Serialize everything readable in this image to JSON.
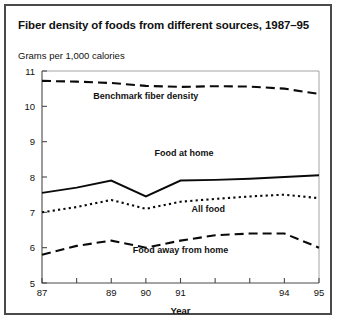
{
  "figure": {
    "title": "Fiber density of foods from different sources, 1987–95",
    "y_axis_title": "Grams per 1,000 calories",
    "x_axis_title": "Year"
  },
  "chart_data": {
    "type": "line",
    "title": "Fiber density of foods from different sources, 1987–95",
    "xlabel": "Year",
    "ylabel": "Grams per 1,000 calories",
    "xlim": [
      87,
      95
    ],
    "ylim": [
      5,
      11
    ],
    "grid": false,
    "legend_position": "inline-annotations",
    "x": [
      87,
      88,
      89,
      90,
      91,
      92,
      93,
      94,
      95
    ],
    "x_tick_labels": [
      "87",
      "",
      "89",
      "90",
      "91",
      "",
      "",
      "94",
      "95"
    ],
    "y_tick_labels": [
      "5",
      "6",
      "7",
      "8",
      "9",
      "10",
      "11"
    ],
    "y_ticks": [
      5,
      6,
      7,
      8,
      9,
      10,
      11
    ],
    "series": [
      {
        "name": "Benchmark fiber density",
        "style": "long-dashed",
        "values": [
          10.72,
          10.7,
          10.66,
          10.58,
          10.55,
          10.57,
          10.56,
          10.5,
          10.35
        ]
      },
      {
        "name": "Food at home",
        "style": "solid",
        "values": [
          7.55,
          7.7,
          7.9,
          7.45,
          7.9,
          7.92,
          7.95,
          8.0,
          8.05
        ]
      },
      {
        "name": "All food",
        "style": "dotted",
        "values": [
          7.0,
          7.15,
          7.35,
          7.1,
          7.3,
          7.38,
          7.45,
          7.5,
          7.4
        ]
      },
      {
        "name": "Food away from home",
        "style": "dashed",
        "values": [
          5.8,
          6.05,
          6.2,
          6.0,
          6.2,
          6.35,
          6.4,
          6.4,
          6.0
        ]
      }
    ],
    "annotations": [
      {
        "text": "Benchmark fiber density",
        "x": 90.0,
        "y": 10.2
      },
      {
        "text": "Food at home",
        "x": 91.1,
        "y": 8.6
      },
      {
        "text": "All food",
        "x": 91.8,
        "y": 7.0
      },
      {
        "text": "Food away from home",
        "x": 91.0,
        "y": 5.85
      }
    ]
  }
}
